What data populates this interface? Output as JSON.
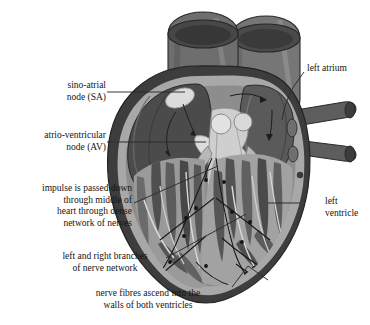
{
  "figure": {
    "background_color": "#ffffff",
    "text_color": "#141414"
  },
  "labels": {
    "sa_node": "sino-atrial\nnode (SA)",
    "av_node": "atrio-ventricular\nnode (AV)",
    "impulse": "impulse is passed down\nthrough middle of\nheart through dense\nnetwork of nerves",
    "branches": "left and right branches\nof nerve network",
    "fibres": "nerve fibres ascend into the\nwalls of both ventricles",
    "left_atrium": "left atrium",
    "left_ventricle": "left\nventricle"
  },
  "palette": {
    "outer_wall_dark": "#3d3d3d",
    "chamber_dark": "#4d4d4d",
    "muscle_mid": "#8d8d8d",
    "muscle_light": "#b0b0b0",
    "lumen_light": "#d2d2d2",
    "node_highlight": "#dcdcdc",
    "vessel_dark": "#5a5a5a",
    "vessel_darker": "#3a3a3a",
    "septum_light": "#c8c8c8",
    "outline": "#2a2a2a",
    "leader_line": "#2b2b2b"
  }
}
